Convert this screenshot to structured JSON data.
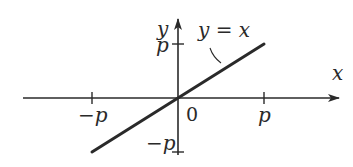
{
  "chart_data": {
    "type": "line",
    "title": "",
    "xlabel": "x",
    "ylabel": "y",
    "xlim": [
      -1,
      1
    ],
    "ylim": [
      -1,
      1
    ],
    "unit_symbol": "p",
    "grid": false,
    "series": [
      {
        "name": "y = x",
        "x": [
          -1,
          1
        ],
        "y": [
          -1,
          1
        ]
      }
    ],
    "annotations": [
      {
        "text": "y = x",
        "points_to": "line"
      }
    ],
    "x_ticks": [
      {
        "value": -1,
        "label": "−p"
      },
      {
        "value": 0,
        "label": "0"
      },
      {
        "value": 1,
        "label": "p"
      }
    ],
    "y_ticks": [
      {
        "value": 1,
        "label": "p"
      },
      {
        "value": -1,
        "label": "−p"
      }
    ]
  },
  "labels": {
    "x_axis": "x",
    "y_axis": "y",
    "curve": "y = x",
    "origin": "0",
    "x_neg": "−p",
    "x_pos": "p",
    "y_pos": "p",
    "y_neg": "−p"
  },
  "colors": {
    "ink": "#2a2a2a",
    "background": "#ffffff"
  }
}
